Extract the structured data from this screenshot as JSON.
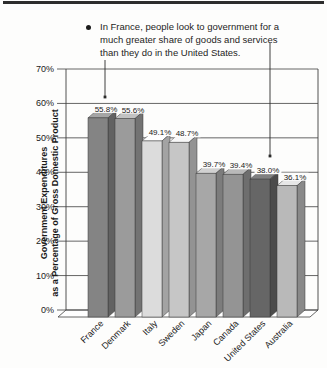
{
  "annotation": {
    "lines": [
      "In France, people look to government for a",
      "much greater share of goods and services",
      "than they do in the United States."
    ]
  },
  "chart_data": {
    "type": "bar",
    "title": "",
    "ylabel_lines": [
      "Government Expenditures",
      "as a Percentage of Gross Domestic Product"
    ],
    "categories": [
      "France",
      "Denmark",
      "Italy",
      "Sweden",
      "Japan",
      "Canada",
      "United States",
      "Australia"
    ],
    "values": [
      55.8,
      55.6,
      49.1,
      48.7,
      39.7,
      39.4,
      38.0,
      36.1
    ],
    "value_labels": [
      "55.8%",
      "55.6%",
      "49.1%",
      "48.7%",
      "39.7%",
      "39.4%",
      "38.0%",
      "36.1%"
    ],
    "bar_colors": [
      "#848484",
      "#9b9b9b",
      "#dcdcdc",
      "#c6c6c6",
      "#a7a7a7",
      "#949494",
      "#666666",
      "#b9b9b9"
    ],
    "y_ticks": [
      "0%",
      "10%",
      "20%",
      "30%",
      "40%",
      "50%",
      "60%",
      "70%"
    ],
    "ylim": [
      0,
      70
    ],
    "grid": true,
    "legend": null,
    "pointers": [
      {
        "target": "France",
        "x": 105,
        "y_start": 60,
        "y_end": 97
      },
      {
        "target": "United States",
        "x": 270,
        "y_start": 43,
        "y_end": 156
      }
    ],
    "line_color": "#3f3f3f"
  }
}
